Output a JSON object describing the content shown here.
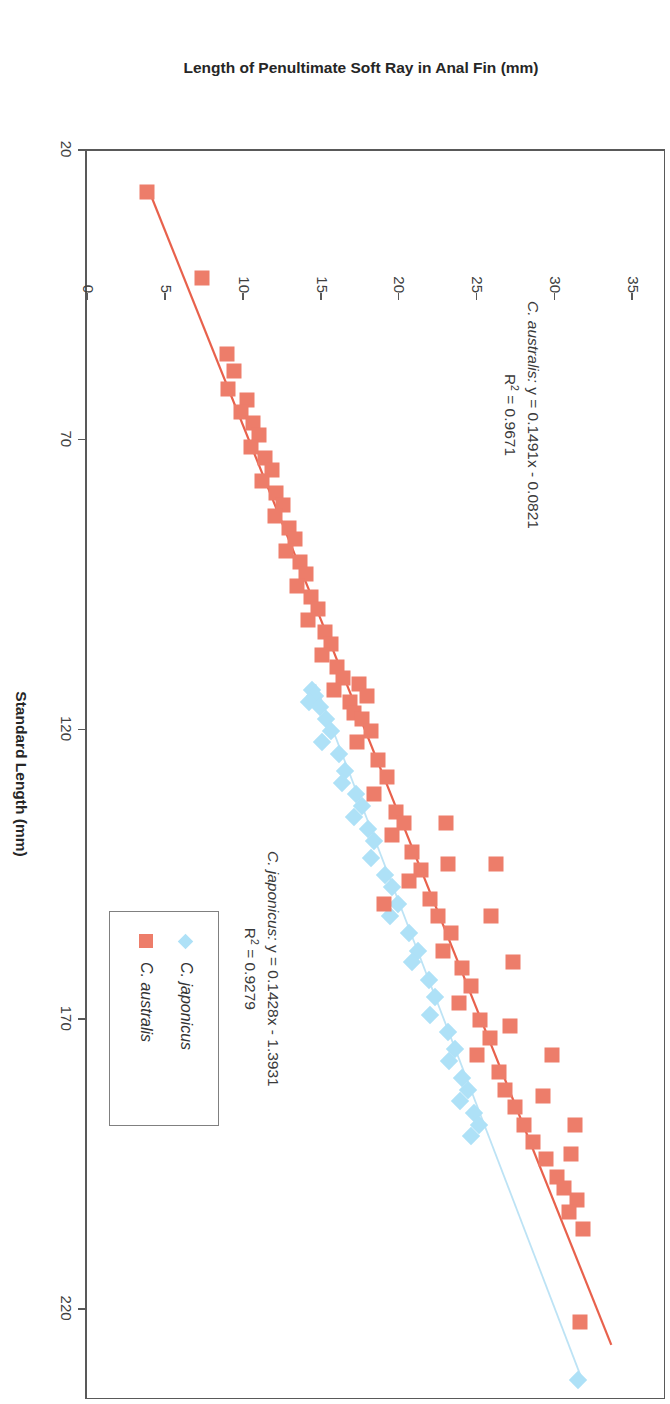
{
  "chart_data": {
    "type": "scatter",
    "title": "Callanthias",
    "xlabel": "Standard Length (mm)",
    "ylabel": "Length of Penultimate Soft Ray in Anal Fin (mm)",
    "xlim": [
      20,
      235
    ],
    "ylim": [
      0,
      37
    ],
    "xticks": [
      20,
      70,
      120,
      170,
      220
    ],
    "yticks": [
      0,
      5,
      10,
      15,
      20,
      25,
      30,
      35
    ],
    "grid": false,
    "legend_position": "center-right-inside",
    "series": [
      {
        "name": "C. japonicus",
        "marker": "diamond",
        "color": "#AEE1F7",
        "trendline": {
          "equation": "y = 0.1428x - 1.3931",
          "slope": 0.1428,
          "intercept": -1.3931,
          "r2": "0.9279",
          "color": "#BDE3F5",
          "x_start": 112,
          "x_end": 232
        },
        "points": [
          [
            113,
            14.4
          ],
          [
            114,
            14.6
          ],
          [
            115,
            14.2
          ],
          [
            116,
            14.9
          ],
          [
            118,
            15.3
          ],
          [
            120,
            15.6
          ],
          [
            122,
            15.0
          ],
          [
            124,
            16.1
          ],
          [
            127,
            16.5
          ],
          [
            129,
            16.3
          ],
          [
            131,
            17.2
          ],
          [
            133,
            17.6
          ],
          [
            135,
            17.1
          ],
          [
            137,
            18.0
          ],
          [
            139,
            18.4
          ],
          [
            142,
            18.2
          ],
          [
            145,
            19.1
          ],
          [
            147,
            19.5
          ],
          [
            150,
            19.9
          ],
          [
            152,
            19.4
          ],
          [
            155,
            20.6
          ],
          [
            158,
            21.2
          ],
          [
            160,
            20.8
          ],
          [
            163,
            21.9
          ],
          [
            166,
            22.3
          ],
          [
            169,
            22.0
          ],
          [
            172,
            23.1
          ],
          [
            175,
            23.6
          ],
          [
            177,
            23.2
          ],
          [
            180,
            24.0
          ],
          [
            182,
            24.4
          ],
          [
            184,
            23.9
          ],
          [
            186,
            24.8
          ],
          [
            188,
            25.1
          ],
          [
            190,
            24.6
          ],
          [
            232,
            31.5
          ]
        ]
      },
      {
        "name": "C. australis",
        "marker": "square",
        "color": "#ED7D6A",
        "trendline": {
          "equation": "y = 0.1491x - 0.0821",
          "slope": 0.1491,
          "intercept": -0.0821,
          "r2": "0.9671",
          "color": "#E8614C",
          "x_start": 26,
          "x_end": 226
        },
        "points": [
          [
            27,
            3.8
          ],
          [
            42,
            7.3
          ],
          [
            55,
            8.9
          ],
          [
            58,
            9.4
          ],
          [
            61,
            9.0
          ],
          [
            63,
            10.2
          ],
          [
            65,
            9.8
          ],
          [
            67,
            10.6
          ],
          [
            69,
            11.0
          ],
          [
            71,
            10.5
          ],
          [
            73,
            11.4
          ],
          [
            75,
            11.8
          ],
          [
            77,
            11.2
          ],
          [
            79,
            12.1
          ],
          [
            81,
            12.5
          ],
          [
            83,
            12.0
          ],
          [
            85,
            12.9
          ],
          [
            87,
            13.3
          ],
          [
            89,
            12.7
          ],
          [
            91,
            13.6
          ],
          [
            93,
            14.0
          ],
          [
            95,
            13.4
          ],
          [
            97,
            14.3
          ],
          [
            99,
            14.8
          ],
          [
            101,
            14.1
          ],
          [
            103,
            15.2
          ],
          [
            105,
            15.6
          ],
          [
            107,
            15.0
          ],
          [
            109,
            16.0
          ],
          [
            111,
            16.4
          ],
          [
            113,
            15.8
          ],
          [
            115,
            16.8
          ],
          [
            117,
            17.1
          ],
          [
            112,
            17.4
          ],
          [
            114,
            17.9
          ],
          [
            118,
            17.6
          ],
          [
            120,
            18.2
          ],
          [
            122,
            17.3
          ],
          [
            125,
            18.6
          ],
          [
            128,
            19.2
          ],
          [
            131,
            18.4
          ],
          [
            134,
            19.8
          ],
          [
            136,
            20.3
          ],
          [
            138,
            19.5
          ],
          [
            141,
            20.8
          ],
          [
            144,
            21.4
          ],
          [
            146,
            20.6
          ],
          [
            149,
            22.0
          ],
          [
            143,
            23.1
          ],
          [
            152,
            22.5
          ],
          [
            155,
            23.3
          ],
          [
            158,
            22.8
          ],
          [
            150,
            19.0
          ],
          [
            161,
            24.0
          ],
          [
            164,
            24.6
          ],
          [
            167,
            23.8
          ],
          [
            170,
            25.2
          ],
          [
            173,
            25.8
          ],
          [
            176,
            25.0
          ],
          [
            179,
            26.4
          ],
          [
            171,
            27.1
          ],
          [
            182,
            26.8
          ],
          [
            185,
            27.4
          ],
          [
            188,
            28.0
          ],
          [
            183,
            29.2
          ],
          [
            191,
            28.6
          ],
          [
            194,
            29.4
          ],
          [
            197,
            30.1
          ],
          [
            193,
            31.0
          ],
          [
            199,
            30.6
          ],
          [
            201,
            31.4
          ],
          [
            203,
            30.9
          ],
          [
            206,
            31.8
          ],
          [
            188,
            31.3
          ],
          [
            176,
            29.8
          ],
          [
            160,
            27.3
          ],
          [
            152,
            25.9
          ],
          [
            143,
            26.2
          ],
          [
            136,
            23.0
          ],
          [
            222,
            31.6
          ]
        ]
      }
    ],
    "annotations": [
      {
        "id": "australis-eq",
        "species": "C. australis:",
        "equation": " y = 0.1491x - 0.0821",
        "r2_prefix": "R",
        "r2_sup": "2",
        "r2_value": " = 0.9671"
      },
      {
        "id": "japonicus-eq",
        "species": "C. japonicus:",
        "equation": " y = 0.1428x - 1.3931",
        "r2_prefix": "R",
        "r2_sup": "2",
        "r2_value": " = 0.9279"
      }
    ],
    "legend": [
      {
        "label": "C. japonicus",
        "marker": "diamond",
        "color": "#AEE1F7"
      },
      {
        "label": "C. australis",
        "marker": "square",
        "color": "#ED7D6A"
      }
    ]
  }
}
